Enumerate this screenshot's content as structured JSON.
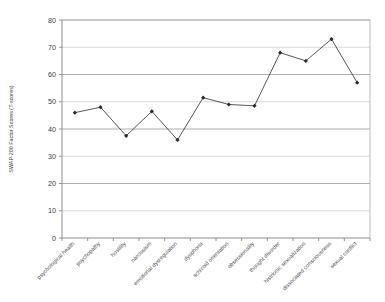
{
  "chart_data": {
    "type": "line",
    "title": "",
    "xlabel": "",
    "ylabel": "SWAP-200 Factor Scores (T-scores)",
    "ylim": [
      0,
      80
    ],
    "ytick_step": 10,
    "yticks": [
      "0",
      "10",
      "20",
      "30",
      "40",
      "50",
      "60",
      "70",
      "80"
    ],
    "grid": true,
    "legend": "none",
    "series_name": "SWAP-200 Factor Scores",
    "categories": [
      "psychological health",
      "psychopathy",
      "hostility",
      "narcissism",
      "emotional dysregulation",
      "dysphoria",
      "schizoid orientation",
      "obsessionality",
      "thought disorder",
      "histrionic sexualization",
      "dissociated consciousness",
      "sexual conflict"
    ],
    "values": [
      46,
      48,
      37.5,
      46.5,
      36,
      51.5,
      49,
      48.5,
      68,
      65,
      73,
      57
    ],
    "marker": "diamond",
    "line_color": "#3a3a3a",
    "marker_color": "#2a2a2a",
    "grid_color": "#9a9a9a",
    "axis_color": "#8d8d8d",
    "background_color": "#ffffff"
  }
}
